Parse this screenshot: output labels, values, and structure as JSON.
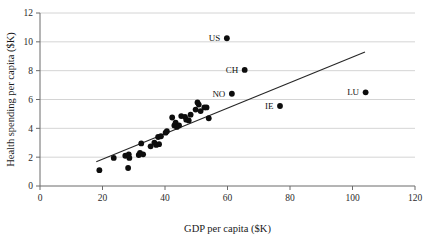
{
  "chart_data": {
    "type": "scatter",
    "title": "",
    "xlabel": "GDP per capita ($K)",
    "ylabel": "Health spending per capita ($K)",
    "xlim": [
      0,
      120
    ],
    "ylim": [
      0,
      12
    ],
    "xticks": [
      0,
      20,
      40,
      60,
      80,
      100,
      120
    ],
    "yticks": [
      0,
      2,
      4,
      6,
      8,
      10,
      12
    ],
    "xtick_labels": [
      "0",
      "20",
      "40",
      "60",
      "80",
      "100",
      "120"
    ],
    "ytick_labels": [
      "0",
      "2",
      "4",
      "6",
      "8",
      "10",
      "12"
    ],
    "grid": "horizontal",
    "legend": "none",
    "series": [
      {
        "name": "Countries",
        "marker": "filled-circle",
        "color": "#0d0d0d",
        "points": [
          {
            "label": "US",
            "x": 59.8,
            "y": 10.25,
            "label_position": "left"
          },
          {
            "label": "CH",
            "x": 65.5,
            "y": 8.05,
            "label_position": "left"
          },
          {
            "label": "NO",
            "x": 61.4,
            "y": 6.4,
            "label_position": "left"
          },
          {
            "label": "LU",
            "x": 104.2,
            "y": 6.5,
            "label_position": "left"
          },
          {
            "label": "IE",
            "x": 76.8,
            "y": 5.55,
            "label_position": "left"
          },
          {
            "label": "",
            "x": 19.0,
            "y": 1.1
          },
          {
            "label": "",
            "x": 23.6,
            "y": 1.95
          },
          {
            "label": "",
            "x": 27.3,
            "y": 2.1
          },
          {
            "label": "",
            "x": 28.2,
            "y": 1.25
          },
          {
            "label": "",
            "x": 28.4,
            "y": 2.2
          },
          {
            "label": "",
            "x": 28.6,
            "y": 1.95
          },
          {
            "label": "",
            "x": 31.6,
            "y": 2.15
          },
          {
            "label": "",
            "x": 32.0,
            "y": 2.3
          },
          {
            "label": "",
            "x": 32.4,
            "y": 2.95
          },
          {
            "label": "",
            "x": 33.0,
            "y": 2.2
          },
          {
            "label": "",
            "x": 35.4,
            "y": 2.75
          },
          {
            "label": "",
            "x": 36.6,
            "y": 3.0
          },
          {
            "label": "",
            "x": 37.2,
            "y": 2.85
          },
          {
            "label": "",
            "x": 38.1,
            "y": 2.9
          },
          {
            "label": "",
            "x": 37.8,
            "y": 3.4
          },
          {
            "label": "",
            "x": 38.7,
            "y": 3.45
          },
          {
            "label": "",
            "x": 40.2,
            "y": 3.7
          },
          {
            "label": "",
            "x": 40.6,
            "y": 3.8
          },
          {
            "label": "",
            "x": 42.3,
            "y": 4.75
          },
          {
            "label": "",
            "x": 43.0,
            "y": 4.2
          },
          {
            "label": "",
            "x": 43.4,
            "y": 4.4
          },
          {
            "label": "",
            "x": 43.8,
            "y": 4.1
          },
          {
            "label": "",
            "x": 44.5,
            "y": 4.2
          },
          {
            "label": "",
            "x": 45.2,
            "y": 4.85
          },
          {
            "label": "",
            "x": 46.4,
            "y": 4.8
          },
          {
            "label": "",
            "x": 46.8,
            "y": 4.6
          },
          {
            "label": "",
            "x": 47.6,
            "y": 4.55
          },
          {
            "label": "",
            "x": 48.2,
            "y": 4.95
          },
          {
            "label": "",
            "x": 49.8,
            "y": 5.3
          },
          {
            "label": "",
            "x": 50.4,
            "y": 5.8
          },
          {
            "label": "",
            "x": 50.8,
            "y": 5.65
          },
          {
            "label": "",
            "x": 51.4,
            "y": 5.2
          },
          {
            "label": "",
            "x": 52.6,
            "y": 5.45
          },
          {
            "label": "",
            "x": 53.3,
            "y": 5.45
          },
          {
            "label": "",
            "x": 54.0,
            "y": 4.7
          }
        ]
      }
    ],
    "trend_line": {
      "name": "Fit line",
      "x_start": 18.0,
      "y_start": 1.68,
      "x_end": 104.0,
      "y_end": 9.3,
      "color": "#262626"
    }
  }
}
